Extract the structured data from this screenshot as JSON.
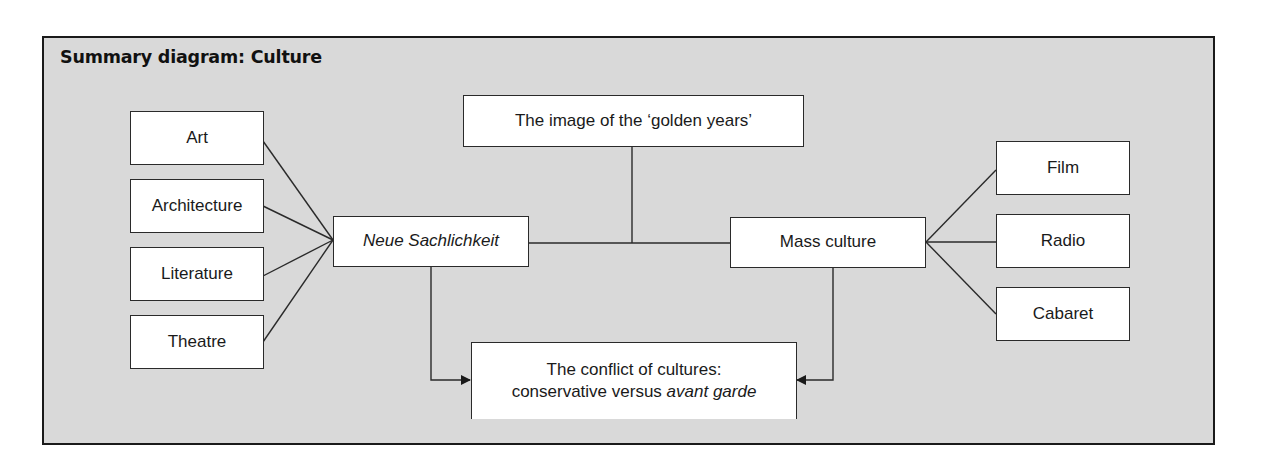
{
  "title": "Summary diagram: Culture",
  "nodes": {
    "art": "Art",
    "architecture": "Architecture",
    "literature": "Literature",
    "theatre": "Theatre",
    "neue_sachlichkeit": "Neue Sachlichkeit",
    "golden_years": "The image of the ‘golden years’",
    "mass_culture": "Mass culture",
    "film": "Film",
    "radio": "Radio",
    "cabaret": "Cabaret",
    "conflict_line1": "The conflict of cultures:",
    "conflict_line2_prefix": "conservative versus ",
    "conflict_line2_italic": "avant garde"
  },
  "edges": [
    {
      "from": "art",
      "to": "neue_sachlichkeit",
      "type": "line"
    },
    {
      "from": "architecture",
      "to": "neue_sachlichkeit",
      "type": "line"
    },
    {
      "from": "literature",
      "to": "neue_sachlichkeit",
      "type": "line"
    },
    {
      "from": "theatre",
      "to": "neue_sachlichkeit",
      "type": "line"
    },
    {
      "from": "golden_years",
      "to": "neue_sachlichkeit/mass_culture connector",
      "type": "line"
    },
    {
      "from": "neue_sachlichkeit",
      "to": "mass_culture",
      "type": "line"
    },
    {
      "from": "mass_culture",
      "to": "film",
      "type": "line"
    },
    {
      "from": "mass_culture",
      "to": "radio",
      "type": "line"
    },
    {
      "from": "mass_culture",
      "to": "cabaret",
      "type": "line"
    },
    {
      "from": "neue_sachlichkeit",
      "to": "conflict",
      "type": "arrow"
    },
    {
      "from": "mass_culture",
      "to": "conflict",
      "type": "arrow"
    }
  ],
  "colors": {
    "panel_bg": "#d9d9d9",
    "box_bg": "#ffffff",
    "stroke": "#2a2a2a"
  }
}
